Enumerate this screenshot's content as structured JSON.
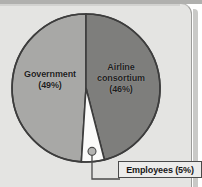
{
  "chart_data": {
    "type": "pie",
    "title": "",
    "categories": [
      "Government",
      "Airline consortium",
      "Employees"
    ],
    "values": [
      49,
      46,
      5
    ],
    "labels": [
      "Government\n(49%)",
      "Airline\nconsortium\n(46%)",
      "Employees (5%)"
    ],
    "legend": "none",
    "units": "percent",
    "start_angle_deg": -90,
    "direction": "counterclockwise",
    "slices": [
      {
        "name": "Government",
        "value": 49,
        "value_label": "(49%)",
        "name_label": "Government",
        "color": "#a8a8a6",
        "label_placement": "inside"
      },
      {
        "name": "Airline consortium",
        "value": 46,
        "value_label": "(46%)",
        "name_label_line1": "Airline",
        "name_label_line2": "consortium",
        "color": "#7e7e7c",
        "label_placement": "inside"
      },
      {
        "name": "Employees",
        "value": 5,
        "value_label": "(5%)",
        "name_label": "Employees (5%)",
        "color": "#fbfbfa",
        "label_placement": "callout"
      }
    ]
  },
  "panel": {
    "background_color": "#e4e4e2",
    "border_color": "#9b9b99"
  },
  "pie": {
    "outline_color": "#3d3d3d",
    "center_x": 86,
    "center_y": 88,
    "radius": 74
  },
  "callout": {
    "text": "Employees (5%)",
    "marker": "dot",
    "marker_color": "#b4b4b2",
    "leader_color": "#4a4a4a",
    "box_border_color": "#4a4a4a",
    "box_fill_color": "#ececeb"
  }
}
